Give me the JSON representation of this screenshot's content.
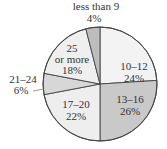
{
  "chart_data": {
    "type": "pie",
    "title": "",
    "categories": [
      "10–12",
      "13–16",
      "17–20",
      "21–24",
      "25 or more",
      "less than 9"
    ],
    "values": [
      24,
      26,
      22,
      6,
      18,
      4
    ],
    "unit": "%",
    "start_angle": "12 o'clock",
    "direction": "clockwise",
    "colors": [
      "#f3f3f3",
      "#c9c9c9",
      "#eeeeee",
      "#d7d7d7",
      "#efefef",
      "#bdbdbd"
    ],
    "labels": {
      "s0": {
        "l1": "10–12",
        "l2": "24%"
      },
      "s1": {
        "l1": "13–16",
        "l2": "26%"
      },
      "s2": {
        "l1": "17–20",
        "l2": "22%"
      },
      "s3": {
        "l1": "21–24",
        "l2": "6%"
      },
      "s4": {
        "l1": "25",
        "l1b": "or more",
        "l2": "18%"
      },
      "s5": {
        "l1": "less than 9",
        "l2": "4%"
      }
    }
  }
}
